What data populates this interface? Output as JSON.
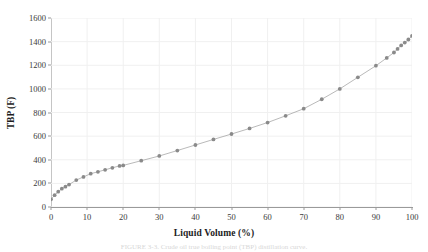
{
  "figure": {
    "caption": "FIGURE 3-3. Crude oil true boiling point (TBP) distillation curve."
  },
  "chart_data": {
    "type": "line",
    "title": "",
    "xlabel": "Liquid Volume (%)",
    "ylabel": "TBP (F)",
    "xlim": [
      0,
      100
    ],
    "ylim": [
      0,
      1600
    ],
    "xticks": [
      0,
      10,
      20,
      30,
      40,
      50,
      60,
      70,
      80,
      90,
      100
    ],
    "yticks": [
      0,
      200,
      400,
      600,
      800,
      1000,
      1200,
      1400,
      1600
    ],
    "xtick_labels": [
      "0",
      "10",
      "20",
      "30",
      "40",
      "50",
      "60",
      "70",
      "80",
      "90",
      "100"
    ],
    "ytick_labels": [
      "0",
      "200",
      "400",
      "600",
      "800",
      "1000",
      "1200",
      "1400",
      "1600"
    ],
    "grid": true,
    "legend": false,
    "marker": "circle",
    "marker_color": "#8a8a8a",
    "line_color": "#9b9b9b",
    "x": [
      0,
      1,
      2,
      3,
      4,
      5,
      7,
      9,
      11,
      13,
      15,
      17,
      19,
      20,
      25,
      30,
      35,
      40,
      45,
      50,
      55,
      60,
      65,
      70,
      75,
      80,
      85,
      90,
      93,
      95,
      96,
      97,
      98,
      99,
      100
    ],
    "y": [
      65,
      100,
      130,
      155,
      172,
      190,
      228,
      255,
      282,
      298,
      315,
      332,
      348,
      352,
      392,
      432,
      478,
      525,
      572,
      618,
      665,
      715,
      772,
      832,
      912,
      1000,
      1098,
      1196,
      1262,
      1308,
      1338,
      1368,
      1392,
      1418,
      1448
    ]
  }
}
